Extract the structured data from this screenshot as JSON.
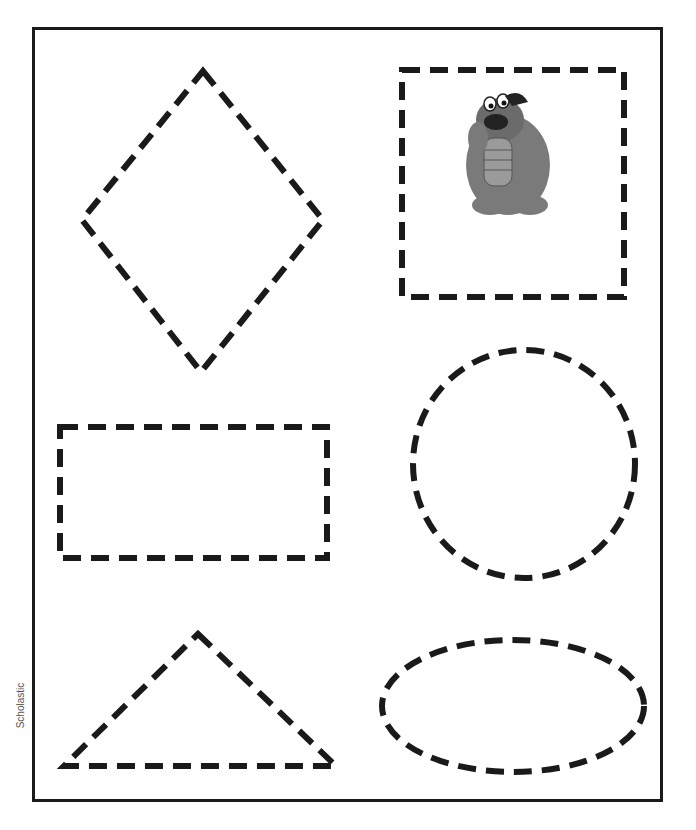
{
  "worksheet": {
    "credit": "Scholastic",
    "character_copyright": "© Sesame Workshop",
    "shapes": [
      {
        "name": "diamond",
        "label": "Diamond"
      },
      {
        "name": "square",
        "label": "Square"
      },
      {
        "name": "rectangle",
        "label": "Rectangle"
      },
      {
        "name": "circle",
        "label": "Circle"
      },
      {
        "name": "triangle",
        "label": "Triangle"
      },
      {
        "name": "oval",
        "label": "Oval"
      }
    ],
    "colors": {
      "stroke": "#1a1a1a",
      "background": "#ffffff",
      "character": "#6b6b6b"
    }
  }
}
